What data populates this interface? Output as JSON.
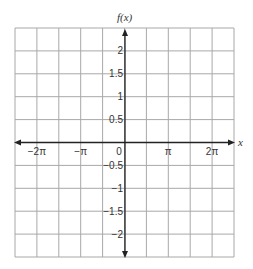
{
  "chart_data": {
    "type": "line",
    "title": "",
    "xlabel": "x",
    "ylabel": "f(x)",
    "series": [],
    "x_tick_labels": [
      "−2π",
      "−π",
      "0",
      "π",
      "2π"
    ],
    "x_tick_values_radians": [
      -6.2832,
      -3.1416,
      0,
      3.1416,
      6.2832
    ],
    "y_tick_labels": [
      "2",
      "1.5",
      "1",
      "0.5",
      "−0.5",
      "−1",
      "−1.5",
      "−2"
    ],
    "y_tick_values": [
      2,
      1.5,
      1,
      0.5,
      -0.5,
      -1,
      -1.5,
      -2
    ],
    "xlim": [
      "-2.5π",
      "2.5π"
    ],
    "ylim": [
      -2.5,
      2.5
    ],
    "grid": true,
    "grid_columns": 10,
    "grid_rows": 10,
    "legend": null,
    "note": "Blank coordinate grid with no plotted function"
  },
  "labels": {
    "y_axis": "f(x)",
    "x_axis": "x",
    "origin": "0"
  },
  "colors": {
    "grid": "#a8a8a8",
    "axis": "#222222",
    "text": "#333333"
  }
}
